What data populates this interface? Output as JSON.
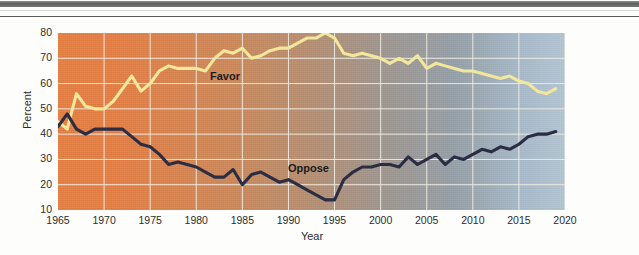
{
  "page": {
    "background_color": "#fdfdfc",
    "rules": [
      {
        "name": "thick-gray-rule",
        "color": "#6e706e"
      },
      {
        "name": "thin-gray-rule",
        "color": "#5a5c5a"
      }
    ]
  },
  "chart_data": {
    "type": "line",
    "title": "",
    "subtitle": "",
    "xlabel": "Year",
    "ylabel": "Percent",
    "xlim": [
      1965,
      2020
    ],
    "ylim": [
      10,
      80
    ],
    "xticks": [
      1965,
      1970,
      1975,
      1980,
      1985,
      1990,
      1995,
      2000,
      2005,
      2010,
      2015,
      2020
    ],
    "yticks": [
      10,
      20,
      30,
      40,
      50,
      60,
      70,
      80
    ],
    "grid": true,
    "grid_color": "#f1ede4",
    "legend": "inline-labels",
    "legend_position": "inline",
    "plot_background": "gradient orange (1965) to blue-gray (2020)",
    "plot_bg_start_color": "#e2783a",
    "plot_bg_end_color": "#aec0ce",
    "annotations": [
      {
        "text": "Favor",
        "x": 1982,
        "y": 60
      },
      {
        "text": "Oppose",
        "x": 1992,
        "y": 25
      }
    ],
    "x": [
      1965,
      1966,
      1967,
      1968,
      1969,
      1970,
      1971,
      1972,
      1973,
      1974,
      1975,
      1976,
      1977,
      1978,
      1979,
      1980,
      1981,
      1982,
      1983,
      1984,
      1985,
      1986,
      1987,
      1988,
      1989,
      1990,
      1991,
      1992,
      1993,
      1994,
      1995,
      1996,
      1997,
      1998,
      1999,
      2000,
      2001,
      2002,
      2003,
      2004,
      2005,
      2006,
      2007,
      2008,
      2009,
      2010,
      2011,
      2012,
      2013,
      2014,
      2015,
      2016,
      2017,
      2018,
      2019
    ],
    "series": [
      {
        "name": "Favor",
        "color": "#f2e79a",
        "values": [
          45,
          42,
          56,
          51,
          50,
          50,
          53,
          58,
          63,
          57,
          60,
          65,
          67,
          66,
          66,
          66,
          65,
          70,
          73,
          72,
          74,
          70,
          71,
          73,
          74,
          74,
          76,
          78,
          78,
          80,
          78,
          72,
          71,
          72,
          71,
          70,
          68,
          70,
          68,
          71,
          66,
          68,
          67,
          66,
          65,
          65,
          64,
          63,
          62,
          63,
          61,
          60,
          57,
          56,
          58
        ]
      },
      {
        "name": "Oppose",
        "color": "#2b2d45",
        "values": [
          43,
          48,
          42,
          40,
          42,
          42,
          42,
          42,
          39,
          36,
          35,
          32,
          28,
          29,
          28,
          27,
          25,
          23,
          23,
          26,
          20,
          24,
          25,
          23,
          21,
          22,
          20,
          18,
          16,
          14,
          14,
          22,
          25,
          27,
          27,
          28,
          28,
          27,
          31,
          28,
          30,
          32,
          28,
          31,
          30,
          32,
          34,
          33,
          35,
          34,
          36,
          39,
          40,
          40,
          41
        ]
      }
    ]
  }
}
